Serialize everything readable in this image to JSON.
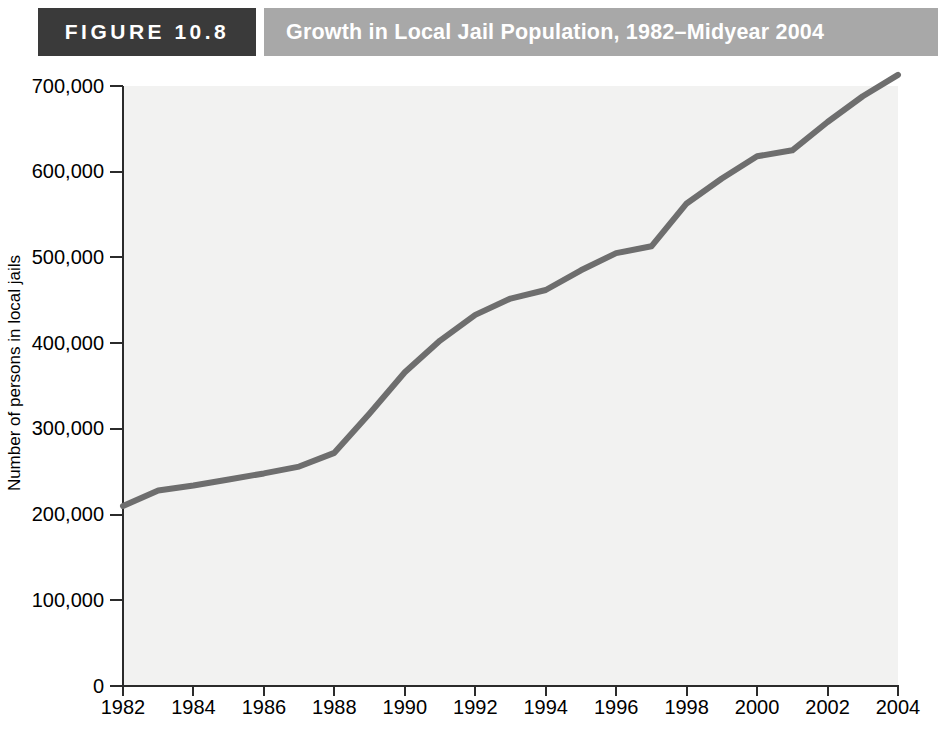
{
  "header": {
    "figure_number": "FIGURE 10.8",
    "title": "Growth in Local Jail Population, 1982–Midyear 2004",
    "number_box_color": "#3a3a3a",
    "title_box_color": "#a8a8a8",
    "text_color": "#ffffff"
  },
  "chart_data": {
    "type": "line",
    "title": "Growth in Local Jail Population, 1982–Midyear 2004",
    "xlabel": "",
    "ylabel": "Number of persons in local jails",
    "x": [
      1982,
      1983,
      1984,
      1985,
      1986,
      1987,
      1988,
      1989,
      1990,
      1991,
      1992,
      1993,
      1994,
      1995,
      1996,
      1997,
      1998,
      1999,
      2000,
      2001,
      2002,
      2003,
      2004
    ],
    "values": [
      210000,
      228000,
      234000,
      241000,
      248000,
      256000,
      272000,
      318000,
      366000,
      403000,
      433000,
      452000,
      462000,
      485000,
      505000,
      513000,
      563000,
      592000,
      618000,
      625000,
      658000,
      688000,
      713000
    ],
    "series": [
      {
        "name": "Local jail population",
        "values": [
          210000,
          228000,
          234000,
          241000,
          248000,
          256000,
          272000,
          318000,
          366000,
          403000,
          433000,
          452000,
          462000,
          485000,
          505000,
          513000,
          563000,
          592000,
          618000,
          625000,
          658000,
          688000,
          713000
        ]
      }
    ],
    "xlim": [
      1982,
      2004
    ],
    "ylim": [
      0,
      700000
    ],
    "ytick_labels": [
      "700,000",
      "600,000",
      "500,000",
      "400,000",
      "300,000",
      "200,000",
      "100,000",
      "0"
    ],
    "ytick_values": [
      700000,
      600000,
      500000,
      400000,
      300000,
      200000,
      100000,
      0
    ],
    "xtick_labels": [
      "1982",
      "1984",
      "1986",
      "1988",
      "1990",
      "1992",
      "1994",
      "1996",
      "1998",
      "2000",
      "2002",
      "2004"
    ],
    "xtick_values": [
      1982,
      1984,
      1986,
      1988,
      1990,
      1992,
      1994,
      1996,
      1998,
      2000,
      2002,
      2004
    ],
    "grid": false,
    "legend": "none",
    "line_color": "#6e6e6e",
    "plot_background": "#f2f2f1",
    "axis_color": "#2b2b2b"
  }
}
